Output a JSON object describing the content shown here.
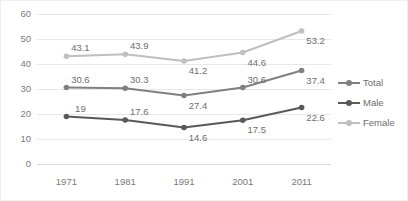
{
  "chart_data": {
    "type": "line",
    "title": "",
    "xlabel": "",
    "ylabel": "",
    "categories": [
      "1971",
      "1981",
      "1991",
      "2001",
      "2011"
    ],
    "ylim": [
      0,
      60
    ],
    "yticks": [
      0,
      10,
      20,
      30,
      40,
      50,
      60
    ],
    "grid": true,
    "legend_position": "right",
    "series": [
      {
        "name": "Total",
        "color": "#808080",
        "values": [
          30.6,
          30.3,
          27.4,
          30.6,
          37.4
        ],
        "labels": [
          "30.6",
          "30.3",
          "27.4",
          "30.6",
          "37.4"
        ],
        "label_side": [
          "above",
          "above",
          "below",
          "above",
          "below"
        ]
      },
      {
        "name": "Male",
        "color": "#595959",
        "values": [
          19,
          17.6,
          14.6,
          17.5,
          22.6
        ],
        "labels": [
          "19",
          "17.6",
          "14.6",
          "17.5",
          "22.6"
        ],
        "label_side": [
          "above",
          "above",
          "below",
          "below",
          "below"
        ]
      },
      {
        "name": "Female",
        "color": "#bfbfbf",
        "values": [
          43.1,
          43.9,
          41.2,
          44.6,
          53.2
        ],
        "labels": [
          "43.1",
          "43.9",
          "41.2",
          "44.6",
          "53.2"
        ],
        "label_side": [
          "above",
          "above",
          "below",
          "below",
          "below"
        ]
      }
    ]
  },
  "legend": {
    "items": [
      {
        "label": "Total",
        "color": "#808080"
      },
      {
        "label": "Male",
        "color": "#595959"
      },
      {
        "label": "Female",
        "color": "#bfbfbf"
      }
    ]
  },
  "axis": {
    "y_tick_labels": [
      "60",
      "50",
      "40",
      "30",
      "20",
      "10",
      "0"
    ],
    "x_tick_labels": [
      "1971",
      "1981",
      "1991",
      "2001",
      "2011"
    ]
  }
}
